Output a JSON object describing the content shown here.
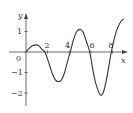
{
  "chart_data": {
    "type": "line",
    "title": "",
    "xlabel": "x",
    "ylabel": "y",
    "origin_label": "0",
    "xlim": [
      0,
      9
    ],
    "ylim": [
      -2.5,
      1.8
    ],
    "grid": false,
    "legend": null,
    "x_ticks": [
      2,
      4,
      6,
      8
    ],
    "x_tick_labels": [
      "2",
      "4",
      "6",
      "8"
    ],
    "y_ticks": [
      1,
      -1,
      -2
    ],
    "y_tick_labels": [
      "1",
      "−1",
      "−2"
    ],
    "series": [
      {
        "name": "curve",
        "x": [
          0,
          0.3,
          0.6,
          0.9,
          1.2,
          1.5,
          1.75,
          2.0,
          2.4,
          2.7,
          3.0,
          3.3,
          3.6,
          3.9,
          4.1,
          4.4,
          4.7,
          5.05,
          5.3,
          5.6,
          5.9,
          6.2,
          6.5,
          6.9,
          7.2,
          7.5,
          7.9,
          8.2,
          8.5,
          8.8,
          9.0
        ],
        "y": [
          0,
          0.18,
          0.3,
          0.35,
          0.3,
          0.12,
          0,
          -0.35,
          -1.0,
          -1.35,
          -1.45,
          -1.35,
          -0.95,
          -0.35,
          0,
          0.6,
          1.0,
          1.1,
          0.95,
          0.5,
          0,
          -0.9,
          -1.6,
          -2.1,
          -1.9,
          -1.2,
          0,
          0.7,
          1.2,
          1.5,
          1.6
        ]
      }
    ]
  },
  "axes": {
    "x_label": "x",
    "y_label": "y",
    "origin": "0",
    "xticks": [
      "2",
      "4",
      "6",
      "8"
    ],
    "yticks": [
      "1",
      "−1",
      "−2"
    ]
  }
}
